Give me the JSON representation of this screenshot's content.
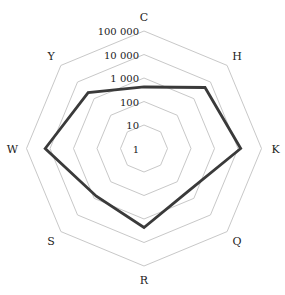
{
  "chart_data": {
    "type": "radar",
    "title": "",
    "scale": "log",
    "axes": [
      "C",
      "H",
      "K",
      "Q",
      "R",
      "S",
      "W",
      "Y"
    ],
    "tick_labels": [
      "1",
      "10",
      "100",
      "1 000",
      "10 000",
      "100 000"
    ],
    "tick_values": [
      1,
      10,
      100,
      1000,
      10000,
      100000
    ],
    "series": [
      {
        "name": "",
        "values": [
          415,
          4700,
          13000,
          410,
          2300,
          740,
          16000,
          2300
        ],
        "color": "#3a3a3a"
      }
    ],
    "grid_color": "#c8c8c8",
    "legend": "none"
  }
}
